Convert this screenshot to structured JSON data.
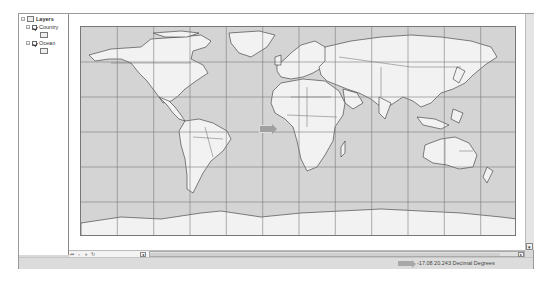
{
  "toc": {
    "root": {
      "label": "Layers",
      "expanded": true
    },
    "layers": [
      {
        "label": "Country",
        "checked": true,
        "expanded": true
      },
      {
        "label": "Ocean",
        "checked": true,
        "expanded": true
      }
    ]
  },
  "map": {
    "projection": "geographic",
    "grid": {
      "columns": 12,
      "rows": 6
    },
    "colors": {
      "ocean": "#d4d4d4",
      "land": "#f2f2f2",
      "border": "#333333",
      "grid": "#7a7a7a"
    }
  },
  "nav_buttons": [
    {
      "icon": "first-icon",
      "glyph": "⏮"
    },
    {
      "icon": "page-icon",
      "glyph": "▫"
    },
    {
      "icon": "pause-icon",
      "glyph": "⏸"
    },
    {
      "icon": "refresh-icon",
      "glyph": "↻"
    }
  ],
  "scroll": {
    "left_arrow": "◂",
    "right_arrow": "▸",
    "down_arrow": "▾"
  },
  "status": {
    "coordinates": "-17.08  20.243 Decimal Degrees"
  }
}
